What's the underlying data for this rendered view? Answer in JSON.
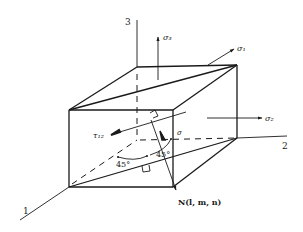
{
  "figure": {
    "type": "stress-element-diagram",
    "axes": {
      "axis_1": "1",
      "axis_2": "2",
      "axis_3": "3"
    },
    "stresses": {
      "sigma_1": "σ₁",
      "sigma_2": "σ₂",
      "sigma_3": "σ₃",
      "tau_12": "τ₁₂",
      "sigma": "σ"
    },
    "normal_vector": "N(l, m, n)",
    "angles": {
      "angle_a": "45°",
      "angle_b": "45°"
    },
    "colors": {
      "ink": "#1a1a1a",
      "background": "#ffffff"
    }
  }
}
